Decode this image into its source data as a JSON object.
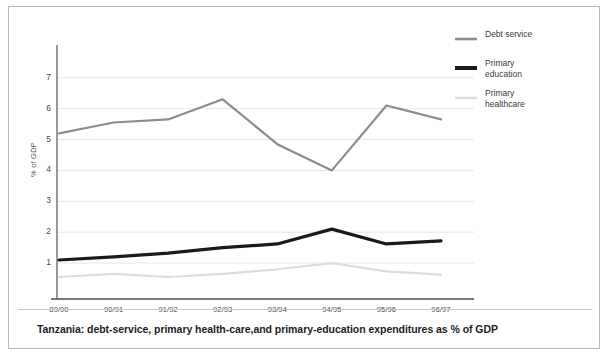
{
  "figure": {
    "caption": "Tanzania: debt-service, primary health-care,and primary-education expenditures as % of GDP"
  },
  "legend": {
    "position": "top-right",
    "entries": [
      {
        "label": "Debt service",
        "color": "#8c8c8c",
        "width": 2.6
      },
      {
        "label": "Primary\neducation",
        "color": "#1a1a1a",
        "width": 4.0
      },
      {
        "label": "Primary\nhealthcare",
        "color": "#dcdcdc",
        "width": 2.6
      }
    ]
  },
  "axes": {
    "ylabel": "% of GDP",
    "xlabel": "",
    "yticks": [
      "1",
      "2",
      "3",
      "4",
      "5",
      "6",
      "7"
    ],
    "xticks": [
      "89/90",
      "90/91",
      "91/92",
      "92/93",
      "93/94",
      "94/95",
      "95/96",
      "96/97"
    ]
  },
  "chart_data": {
    "type": "line",
    "title": "Tanzania: debt-service, primary health-care,and primary-education expenditures as % of GDP",
    "xlabel": "",
    "ylabel": "% of GDP",
    "categories": [
      "89/90",
      "90/91",
      "91/92",
      "92/93",
      "93/94",
      "94/95",
      "95/96",
      "96/97"
    ],
    "ylim": [
      0,
      7.3
    ],
    "yticks": [
      1,
      2,
      3,
      4,
      5,
      6,
      7
    ],
    "grid": "horizontal",
    "legend_position": "top-right",
    "series": [
      {
        "name": "Debt service",
        "color": "#8c8c8c",
        "values": [
          5.2,
          5.55,
          5.65,
          6.3,
          4.85,
          4.0,
          6.1,
          5.65
        ]
      },
      {
        "name": "Primary education",
        "color": "#1a1a1a",
        "values": [
          1.1,
          1.2,
          1.32,
          1.5,
          1.62,
          2.1,
          1.62,
          1.72
        ]
      },
      {
        "name": "Primary healthcare",
        "color": "#dcdcdc",
        "values": [
          0.55,
          0.65,
          0.55,
          0.65,
          0.8,
          1.0,
          0.73,
          0.63
        ]
      }
    ]
  }
}
